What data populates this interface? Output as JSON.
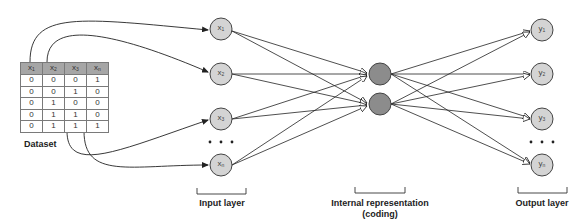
{
  "dataset": {
    "label": "Dataset",
    "columns": [
      {
        "base": "x",
        "sub": "1"
      },
      {
        "base": "x",
        "sub": "2"
      },
      {
        "base": "x",
        "sub": "3"
      },
      {
        "base": "x",
        "sub": "n"
      }
    ],
    "rows": [
      [
        "0",
        "0",
        "0",
        "1"
      ],
      [
        "0",
        "0",
        "1",
        "0"
      ],
      [
        "0",
        "1",
        "0",
        "0"
      ],
      [
        "0",
        "1",
        "1",
        "0"
      ],
      [
        "0",
        "1",
        "1",
        "1"
      ]
    ]
  },
  "layers": {
    "input": {
      "label": "Input layer",
      "nodes": [
        {
          "base": "x",
          "sub": "1"
        },
        {
          "base": "x",
          "sub": "2"
        },
        {
          "base": "x",
          "sub": "3"
        },
        {
          "base": "x",
          "sub": "n"
        }
      ],
      "ellipsis": "• • •"
    },
    "coding": {
      "label_line1": "Internal representation",
      "label_line2": "(coding)",
      "node_count": 2
    },
    "output": {
      "label": "Output layer",
      "nodes": [
        {
          "base": "y",
          "sub": "1"
        },
        {
          "base": "y",
          "sub": "2"
        },
        {
          "base": "y",
          "sub": "3"
        },
        {
          "base": "y",
          "sub": "n"
        }
      ],
      "ellipsis": "• • •"
    }
  },
  "colors": {
    "node_fill": "#d4d4d4",
    "coding_fill": "#8c8c8c",
    "stroke": "#333333",
    "header_fill": "#a6a6a6"
  }
}
